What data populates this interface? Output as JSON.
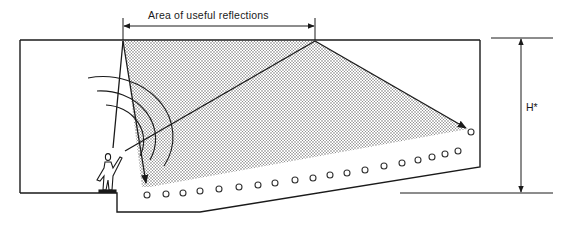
{
  "diagram": {
    "title": "Area of useful reflections",
    "dimension_label": "H*",
    "colors": {
      "line": "#1a1a1a",
      "dots": "#555555",
      "background": "#ffffff"
    },
    "elements": {
      "ceiling": "ceiling reflector line",
      "speaker": "human figure on stage with sound waves",
      "audience_seats": 24,
      "rays": [
        "direct ray to ceiling and down to front seats",
        "ray to ceiling reflected to rear seats"
      ]
    }
  }
}
